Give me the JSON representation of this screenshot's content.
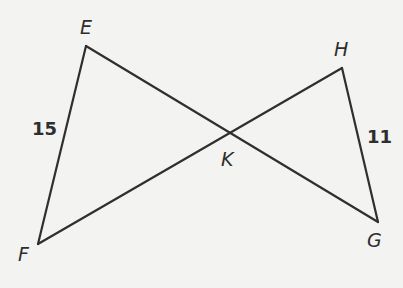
{
  "diagram": {
    "type": "two triangles sharing vertex K (bowtie)",
    "vertices": {
      "E": {
        "label": "E",
        "x": 86,
        "y": 46
      },
      "F": {
        "label": "F",
        "x": 38,
        "y": 244
      },
      "K": {
        "label": "K",
        "x": 230,
        "y": 133
      },
      "H": {
        "label": "H",
        "x": 342,
        "y": 68
      },
      "G": {
        "label": "G",
        "x": 378,
        "y": 222
      }
    },
    "segments": [
      {
        "name": "EF",
        "from": "E",
        "to": "F",
        "length_label": "15"
      },
      {
        "name": "EG",
        "from": "E",
        "to": "G"
      },
      {
        "name": "FH",
        "from": "F",
        "to": "H"
      },
      {
        "name": "HG",
        "from": "H",
        "to": "G",
        "length_label": "11"
      }
    ],
    "measurements": {
      "EF": "15",
      "HG": "11"
    },
    "colors": {
      "line": "#2f2f2f",
      "text": "#2e2e2e",
      "background": "#f3f3f1"
    }
  }
}
